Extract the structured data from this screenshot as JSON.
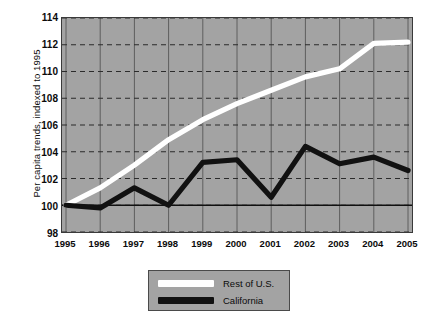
{
  "chart_data": {
    "type": "line",
    "title": "",
    "xlabel": "",
    "ylabel": "Per capita trends, indexed to 1995",
    "x": [
      1995,
      1996,
      1997,
      1998,
      1999,
      2000,
      2001,
      2002,
      2003,
      2004,
      2005
    ],
    "xtick_labels": [
      "1995",
      "1996",
      "1997",
      "1998",
      "1999",
      "2000",
      "2001",
      "2002",
      "2003",
      "2004",
      "2005"
    ],
    "ytick_labels": [
      "98",
      "100",
      "102",
      "104",
      "106",
      "108",
      "110",
      "112",
      "114"
    ],
    "yticks": [
      98,
      100,
      102,
      104,
      106,
      108,
      110,
      112,
      114
    ],
    "ylim": [
      98,
      114
    ],
    "xlim": [
      1995,
      2005
    ],
    "grid": "horizontal dashed, vertical solid",
    "legend_position": "below-center",
    "reference_line": 100,
    "series": [
      {
        "name": "Rest of U.S.",
        "color": "#ffffff",
        "values": [
          100.0,
          101.3,
          103.0,
          104.9,
          106.4,
          107.6,
          108.6,
          109.6,
          110.2,
          112.1,
          112.2
        ]
      },
      {
        "name": "California",
        "color": "#111111",
        "values": [
          100.0,
          99.8,
          101.3,
          100.0,
          103.2,
          103.4,
          100.6,
          104.4,
          103.1,
          103.6,
          102.6
        ]
      }
    ]
  },
  "legend": {
    "items": [
      {
        "label": "Rest of U.S.",
        "swatch": "#ffffff"
      },
      {
        "label": "California",
        "swatch": "#111111"
      }
    ]
  },
  "colors": {
    "plot_background": "#a3a3a3",
    "gridline": "#333333",
    "frame": "#3a3a3a",
    "series_rest_of_us": "#ffffff",
    "series_california": "#111111",
    "text": "#0b0b0b"
  }
}
